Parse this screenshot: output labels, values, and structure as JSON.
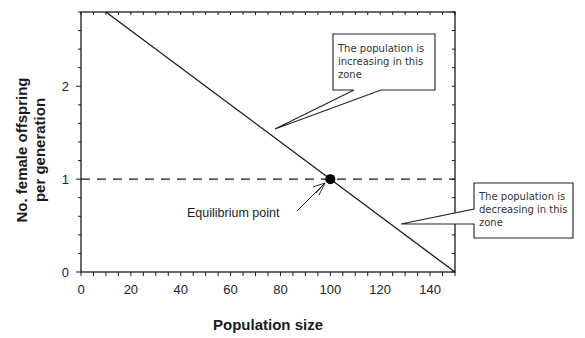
{
  "chart_data": {
    "type": "line",
    "title": "",
    "xlabel": "Population size",
    "ylabel_lines": [
      "No. female offspring",
      "per generation"
    ],
    "ylabel": "No. female offspring per generation",
    "xlim": [
      0,
      150
    ],
    "ylim": [
      0,
      2.8
    ],
    "x_ticks": [
      0,
      20,
      40,
      60,
      80,
      100,
      120,
      140
    ],
    "x_minor_step": 5,
    "y_ticks": [
      0,
      1,
      2
    ],
    "y_minor_step": 0.2,
    "grid": false,
    "frame": "box",
    "series": [
      {
        "name": "Offspring per generation",
        "style": "solid",
        "color": "#1a1a1a",
        "x": [
          10,
          150
        ],
        "y": [
          2.8,
          0
        ]
      },
      {
        "name": "Replacement level",
        "style": "dashed",
        "color": "#1a1a1a",
        "x": [
          0,
          150
        ],
        "y": [
          1,
          1
        ]
      }
    ],
    "points": [
      {
        "name": "Equilibrium point",
        "x": 100,
        "y": 1,
        "color": "#000000"
      }
    ],
    "annotations": [
      {
        "id": "equilibrium",
        "text": "Equilibrium point",
        "target": [
          100,
          1
        ]
      },
      {
        "id": "increasing",
        "lines": [
          "The population is",
          "increasing in this",
          "zone"
        ],
        "target": [
          78,
          1.44
        ]
      },
      {
        "id": "decreasing",
        "lines": [
          "The population is",
          "decreasing in this",
          "zone"
        ],
        "target": [
          128,
          0.52
        ]
      }
    ]
  }
}
